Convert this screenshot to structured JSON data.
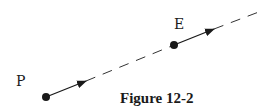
{
  "figure": {
    "caption": "Figure 12-2",
    "points": {
      "P": {
        "label": "P",
        "x": 46,
        "y": 97
      },
      "E": {
        "label": "E",
        "x": 174,
        "y": 45
      }
    },
    "line": {
      "style": "dashed",
      "from": [
        46,
        97
      ],
      "to": [
        264,
        11
      ]
    },
    "vectors": [
      {
        "name": "velocity-at-P",
        "from": [
          46,
          97
        ],
        "to": [
          86,
          81
        ]
      },
      {
        "name": "velocity-at-E",
        "from": [
          174,
          45
        ],
        "to": [
          214,
          29
        ]
      }
    ],
    "colors": {
      "ink": "#1a1a1a",
      "background": "#ffffff"
    }
  }
}
